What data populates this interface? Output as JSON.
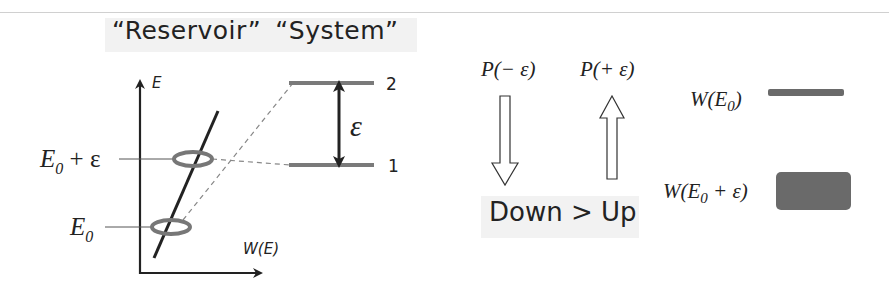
{
  "title": {
    "reservoir": "“Reservoir”",
    "system": "“System”"
  },
  "reservoir_plot": {
    "y_axis_label": "E",
    "x_axis_label": "W(E)",
    "level_upper": {
      "main": "E",
      "sub": "0",
      "suffix": " + ε"
    },
    "level_lower": {
      "main": "E",
      "sub": "0"
    }
  },
  "system": {
    "level_2_label": "2",
    "level_1_label": "1",
    "gap_label": "ε"
  },
  "transitions": {
    "down_label": "P(− ε)",
    "up_label": "P(+ ε)",
    "comparison": "Down > Up"
  },
  "weights": {
    "w_e0_label": "W(E0)",
    "w_e0_eps_label": "W(E0 + ε)"
  },
  "colors": {
    "line": "#222222",
    "level_gray": "#7a7a7a",
    "ellipse_gray": "#777777",
    "box_fill": "#6a6a6a",
    "label_bg": "#f2f2f2"
  }
}
